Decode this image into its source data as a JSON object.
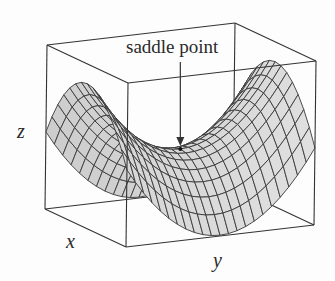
{
  "figure": {
    "annotation": "saddle point",
    "axis_labels": {
      "x": "x",
      "y": "y",
      "z": "z"
    },
    "colors": {
      "line": "#333333",
      "surface": "#d8d8d8",
      "mesh": "#3a3a3a",
      "background": "#fdfdfd"
    }
  },
  "chart_data": {
    "type": "surface",
    "function": "z = y^2 - x^2",
    "title": "",
    "xlabel": "x",
    "ylabel": "y",
    "zlabel": "z",
    "xlim": [
      -1,
      1
    ],
    "ylim": [
      -1,
      1
    ],
    "grid_divisions": {
      "x": 14,
      "y": 22
    },
    "annotations": [
      {
        "text": "saddle point",
        "at": [
          0,
          0,
          0
        ]
      }
    ],
    "projection": {
      "origin": [
        47,
        45
      ],
      "x_vec": [
        81,
        38
      ],
      "y_vec": [
        188,
        -22
      ],
      "z_vec": [
        -2,
        164
      ],
      "z_map": {
        "offset": -0.17,
        "y2": 0.93,
        "x2": 0.82
      }
    }
  }
}
